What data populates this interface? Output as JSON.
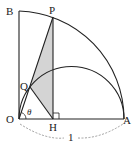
{
  "diagram": {
    "type": "geometry",
    "labels": {
      "B": "B",
      "P": "P",
      "Q": "Q",
      "O": "O",
      "H": "H",
      "A": "A",
      "theta": "θ",
      "radius": "1"
    },
    "colors": {
      "stroke": "#222222",
      "shade": "#d4d4d4",
      "dashed": "#888888"
    }
  }
}
